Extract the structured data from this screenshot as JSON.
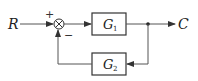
{
  "diagram": {
    "type": "block-diagram",
    "input": "R",
    "output": "C",
    "summing_junction": {
      "plus_sign": "+",
      "minus_sign": "−"
    },
    "blocks": [
      {
        "id": "G1",
        "symbol": "G",
        "subscript": "1",
        "path": "forward"
      },
      {
        "id": "G2",
        "symbol": "G",
        "subscript": "2",
        "path": "feedback"
      }
    ],
    "line_color": "#555555"
  }
}
